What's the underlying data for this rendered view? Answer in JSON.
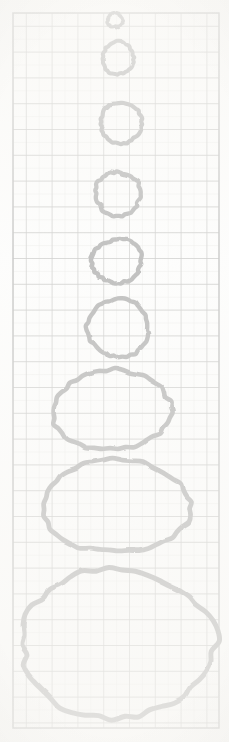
{
  "document": {
    "kind": "scanned-graph-paper-figure",
    "title": "Hand-drawn circles on graph paper",
    "background_color": "#fdfdfc",
    "ink_color": "#111111"
  },
  "grid": {
    "name": "graph-paper-grid",
    "left": 13,
    "top": 13,
    "right": 219,
    "bottom": 728,
    "minor_spacing": 12.9,
    "major_spacing": 25.8,
    "minor_color": "#b9b9b4",
    "major_color": "#4a4a48",
    "border_color": "#3d3d3b",
    "columns_minor": 16,
    "rows_minor": 55
  },
  "chart_data": {
    "type": "scatter",
    "xlabel": "",
    "ylabel": "",
    "xlim": [
      13,
      219
    ],
    "ylim": [
      13,
      728
    ],
    "grid": true,
    "legend": "none",
    "note": "Nine closed freehand loops stacked vertically, each larger than the one above",
    "categories": [
      "1",
      "2",
      "3",
      "4",
      "5",
      "6",
      "7",
      "8",
      "9"
    ],
    "values": [
      15,
      31,
      41,
      45,
      50,
      62,
      118,
      147,
      193
    ],
    "series": [
      {
        "name": "circle-width-px",
        "values": [
          15,
          31,
          41,
          45,
          50,
          62,
          118,
          147,
          193
        ]
      },
      {
        "name": "circle-height-px",
        "values": [
          14,
          33,
          41,
          44,
          43,
          57,
          79,
          93,
          148
        ]
      }
    ],
    "points": [
      {
        "id": "circle-1",
        "cx": 115,
        "cy": 20,
        "rx": 7.5,
        "ry": 7.0,
        "rot": -8,
        "stroke": 3.2
      },
      {
        "id": "circle-2",
        "cx": 118,
        "cy": 58,
        "rx": 15.5,
        "ry": 16.5,
        "rot": 6,
        "stroke": 4.0
      },
      {
        "id": "circle-3",
        "cx": 121,
        "cy": 123,
        "rx": 20.5,
        "ry": 20.5,
        "rot": -4,
        "stroke": 4.2
      },
      {
        "id": "circle-4",
        "cx": 118,
        "cy": 194,
        "rx": 22.5,
        "ry": 22.0,
        "rot": 9,
        "stroke": 4.3
      },
      {
        "id": "circle-5",
        "cx": 117,
        "cy": 261,
        "rx": 25.0,
        "ry": 21.5,
        "rot": -6,
        "stroke": 4.4
      },
      {
        "id": "circle-6",
        "cx": 118,
        "cy": 328,
        "rx": 31.0,
        "ry": 28.5,
        "rot": 4,
        "stroke": 4.4
      },
      {
        "id": "circle-7",
        "cx": 112,
        "cy": 410,
        "rx": 59.0,
        "ry": 39.5,
        "rot": -3,
        "stroke": 4.6
      },
      {
        "id": "circle-8",
        "cx": 116,
        "cy": 506,
        "rx": 73.5,
        "ry": 46.5,
        "rot": 2,
        "stroke": 4.8
      },
      {
        "id": "circle-9",
        "cx": 117,
        "cy": 643,
        "rx": 96.5,
        "ry": 74.0,
        "rot": -1,
        "stroke": 5.0
      }
    ]
  }
}
